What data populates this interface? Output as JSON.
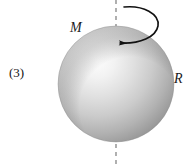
{
  "figure": {
    "caption_index": "(3)",
    "background_color": "#ffffff"
  },
  "labels": {
    "index": "(3)",
    "mass": "M",
    "radius": "R"
  },
  "sphere": {
    "name": "solid-sphere",
    "center_x": 116,
    "center_y": 84,
    "radius": 58,
    "highlight_x": 95,
    "highlight_y": 78,
    "color_light": "#fbfbfb",
    "color_mid": "#d3d3d3",
    "color_dark": "#8e8e8e",
    "color_edge": "#7c7c7c"
  },
  "axis": {
    "name": "rotation-axis",
    "x": 116,
    "y_top": 0,
    "y_bottom": 166,
    "style": "dashed",
    "color": "#6f6f6f",
    "dash_pattern": "4 4",
    "width": 1.1
  },
  "rotation_arrow": {
    "name": "rotation-direction-arrow",
    "color": "#111111",
    "width": 1.6,
    "direction": "counterclockwise-viewed-from-above",
    "start_x": 124,
    "start_y": 7,
    "tip_x": 108,
    "tip_y": 43
  }
}
